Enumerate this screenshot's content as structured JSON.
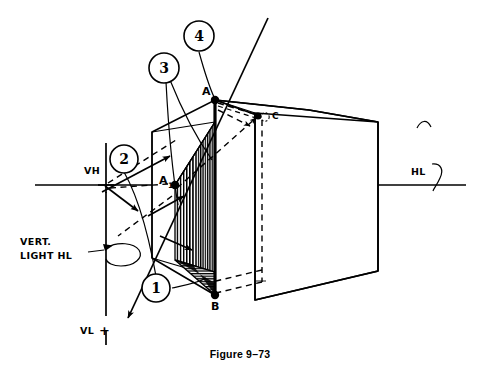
{
  "figure": {
    "caption": "Figure 9–73",
    "callouts": [
      {
        "id": "1",
        "label": "1"
      },
      {
        "id": "2",
        "label": "2"
      },
      {
        "id": "3",
        "label": "3"
      },
      {
        "id": "4",
        "label": "4"
      }
    ],
    "vertex_labels": {
      "a": "A",
      "a1": "A",
      "a1_sub": "1",
      "b": "B",
      "c": "C"
    },
    "axis_labels": {
      "vh": "VH",
      "vl": "VL",
      "vl_mark": "+",
      "hl_right": "HL"
    },
    "notes": {
      "vert_light_line1": "VERT.",
      "vert_light_line2": "LIGHT HL"
    },
    "colors": {
      "ink": "#000000",
      "paper": "#ffffff"
    }
  }
}
